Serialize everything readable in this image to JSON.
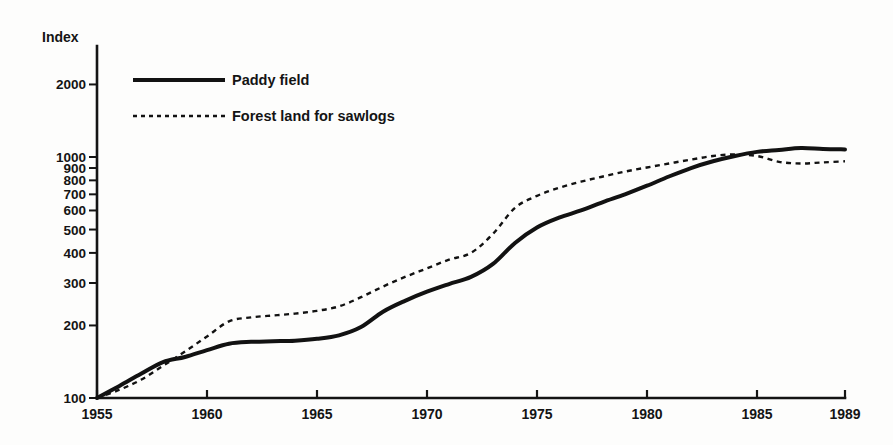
{
  "chart_data": {
    "type": "line",
    "title": "",
    "subtitle": "",
    "xlabel": "",
    "ylabel": "Index",
    "yscale": "log",
    "ylim": [
      100,
      2400
    ],
    "xlim": [
      1955,
      1989
    ],
    "grid": false,
    "legend_position": "top-left",
    "y_ticks": [
      100,
      200,
      300,
      400,
      500,
      600,
      700,
      800,
      900,
      1000,
      2000
    ],
    "y_tick_labels": [
      "100",
      "200",
      "300",
      "400",
      "500",
      "600",
      "700",
      "800",
      "900",
      "1000",
      "2000"
    ],
    "x_ticks": [
      1955,
      1960,
      1965,
      1970,
      1975,
      1980,
      1985,
      1989
    ],
    "x_tick_labels": [
      "1955",
      "1960",
      "1965",
      "1970",
      "1975",
      "1980",
      "1985",
      "1989"
    ],
    "x": [
      1955,
      1956,
      1957,
      1958,
      1959,
      1960,
      1961,
      1962,
      1963,
      1964,
      1965,
      1966,
      1967,
      1968,
      1969,
      1970,
      1971,
      1972,
      1973,
      1974,
      1975,
      1976,
      1977,
      1978,
      1979,
      1980,
      1981,
      1982,
      1983,
      1984,
      1985,
      1986,
      1987,
      1988,
      1989
    ],
    "series": [
      {
        "name": "Paddy field",
        "style": "solid",
        "color": "#121212",
        "values": [
          100,
          112,
          126,
          141,
          148,
          158,
          168,
          171,
          172,
          173,
          176,
          182,
          197,
          228,
          253,
          276,
          297,
          318,
          360,
          440,
          510,
          560,
          600,
          650,
          700,
          760,
          830,
          900,
          960,
          1010,
          1050,
          1070,
          1090,
          1080,
          1075
        ]
      },
      {
        "name": "Forest land for sawlogs",
        "style": "dotted",
        "color": "#121212",
        "values": [
          100,
          108,
          119,
          136,
          156,
          180,
          208,
          216,
          220,
          224,
          230,
          240,
          262,
          290,
          318,
          345,
          375,
          400,
          480,
          615,
          690,
          745,
          790,
          830,
          870,
          905,
          940,
          975,
          1010,
          1025,
          1010,
          955,
          940,
          950,
          960
        ]
      }
    ]
  },
  "legend": {
    "items": [
      {
        "label": "Paddy field",
        "style": "solid"
      },
      {
        "label": "Forest land for sawlogs",
        "style": "dotted"
      }
    ]
  },
  "axis": {
    "y_title": "Index"
  }
}
